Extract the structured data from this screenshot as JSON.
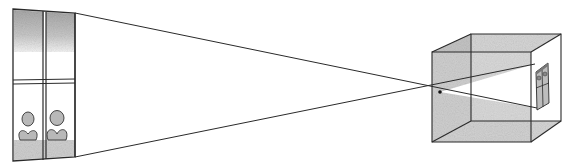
{
  "diagram": {
    "type": "camera-obscura",
    "colors": {
      "line": "#2a2a2a",
      "shade": "#cfcfcf",
      "shade_dark": "#a9a9a9",
      "background": "#ffffff"
    },
    "elements": {
      "object": "window-with-flowers",
      "pinhole": "pinhole",
      "box": "camera-box",
      "image": "inverted-projected-image"
    }
  }
}
